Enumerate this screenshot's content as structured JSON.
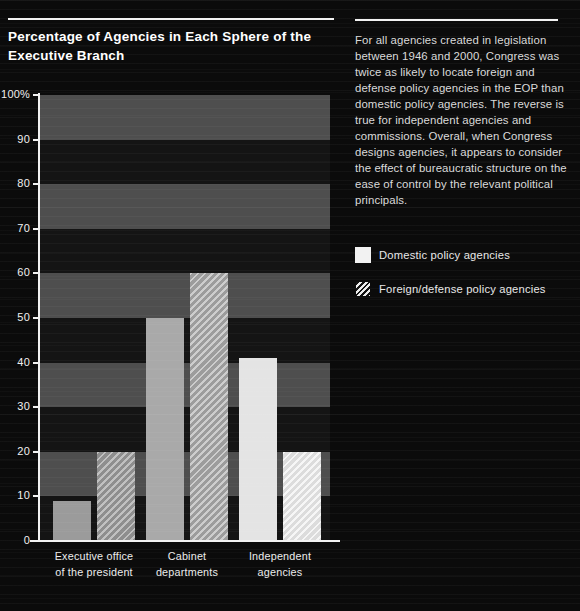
{
  "page": {
    "background": "#0b0b0b"
  },
  "header": {
    "title": "Percentage of Agencies in Each Sphere of the Executive Branch"
  },
  "sidebar": {
    "paragraph": "For all agencies created in legislation between 1946 and 2000, Congress was twice as likely to locate foreign and defense policy agencies in the EOP than domestic policy agencies. The reverse is true for independent agencies and commissions. Overall, when Congress designs agencies, it appears to consider the effect of bureaucratic structure on the ease of control by the relevant political principals."
  },
  "chart_data": {
    "type": "bar",
    "title": "Percentage of Agencies in Each Sphere of the Executive Branch",
    "categories": [
      [
        "Executive office",
        "of the president"
      ],
      [
        "Cabinet",
        "departments"
      ],
      [
        "Independent",
        "agencies"
      ]
    ],
    "series": [
      {
        "name": "Domestic policy agencies",
        "pattern": "solid",
        "values": [
          9,
          50,
          41
        ],
        "colors": [
          "#9b9b9b",
          "#a9a9a9",
          "#e4e4e4"
        ]
      },
      {
        "name": "Foreign/defense policy agencies",
        "pattern": "hatch",
        "values": [
          20,
          60,
          20
        ],
        "colors": [
          "#8e8e8e",
          "#9c9c9c",
          "#dcdcdc"
        ],
        "stripe_colors": [
          "#c0c0c0",
          "#cdcdcd",
          "#f6f6f6"
        ]
      }
    ],
    "ylabel_ticks": [
      "100%",
      "90",
      "80",
      "70",
      "60",
      "50",
      "40",
      "30",
      "20",
      "10",
      "0"
    ],
    "ylim": [
      0,
      100
    ],
    "grid": "horizontal-bands",
    "band_colors": [
      "#4e4e4e",
      "#141414"
    ],
    "axis_color": "#f2f2f2",
    "legend_position": "right"
  }
}
